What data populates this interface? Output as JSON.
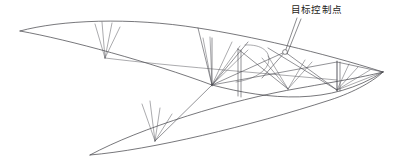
{
  "figure": {
    "kind": "engineering-wireframe-diagram",
    "width": 403,
    "height": 164,
    "background_color": "#ffffff",
    "line_color": "#4a4a50",
    "edge_color": "#3c3c42",
    "text_color": "#1e1e22"
  },
  "annotations": [
    {
      "id": "target-control-point",
      "label": "目标控制点",
      "label_x": 291,
      "label_y": 4,
      "leader_from_x": 297,
      "leader_from_y": 18,
      "leader_to_x": 285,
      "leader_to_y": 52
    }
  ],
  "nodes": [
    {
      "id": "left-tip",
      "x": 20,
      "y": 31
    },
    {
      "id": "upper-fan-apex",
      "x": 105,
      "y": 58
    },
    {
      "id": "mid-junction",
      "x": 212,
      "y": 85
    },
    {
      "id": "lower-fan-apex",
      "x": 155,
      "y": 141
    },
    {
      "id": "bottom-left-tip",
      "x": 90,
      "y": 155
    },
    {
      "id": "control-node",
      "x": 285,
      "y": 52
    },
    {
      "id": "right-post-top",
      "x": 337,
      "y": 62
    },
    {
      "id": "right-post-base",
      "x": 337,
      "y": 90
    },
    {
      "id": "right-tip",
      "x": 383,
      "y": 72
    }
  ],
  "paths": {
    "upper_surface_curve": "M 20 31 C 60 20, 130 17, 198 28 C 250 36, 320 52, 383 72",
    "upper_lower_chord": "M 20 31 C 70 40, 150 62, 212 85 C 270 100, 330 106, 383 72",
    "mid_chord": "M 105 58 C 170 66, 250 72, 337 80",
    "lower_outline_top": "M 90 155 C 140 128, 230 100, 300 88 C 340 81, 368 76, 383 72",
    "lower_outline_bottom": "M 90 155 C 150 150, 250 126, 330 100 C 355 92, 375 80, 383 72",
    "ribbon_curve": "M 245 45 C 262 44, 272 52, 268 64 C 264 74, 250 80, 236 82"
  },
  "fans": [
    {
      "id": "upper-left-fan",
      "apex_x": 105,
      "apex_y": 58,
      "rays": [
        {
          "x": 95,
          "y": 24
        },
        {
          "x": 102,
          "y": 22
        },
        {
          "x": 112,
          "y": 23
        },
        {
          "x": 120,
          "y": 27
        }
      ]
    },
    {
      "id": "lower-left-fan",
      "apex_x": 155,
      "apex_y": 141,
      "rays": [
        {
          "x": 142,
          "y": 104
        },
        {
          "x": 150,
          "y": 101
        },
        {
          "x": 160,
          "y": 108
        },
        {
          "x": 172,
          "y": 114
        }
      ]
    },
    {
      "id": "mid-junction-fan",
      "apex_x": 212,
      "apex_y": 85,
      "rays": [
        {
          "x": 203,
          "y": 38
        },
        {
          "x": 210,
          "y": 37
        },
        {
          "x": 232,
          "y": 42
        },
        {
          "x": 240,
          "y": 46
        },
        {
          "x": 248,
          "y": 50
        }
      ]
    },
    {
      "id": "right-post-fan",
      "apex_x": 337,
      "apex_y": 90,
      "rays": [
        {
          "x": 337,
          "y": 62
        },
        {
          "x": 349,
          "y": 64
        },
        {
          "x": 358,
          "y": 67
        },
        {
          "x": 370,
          "y": 70
        },
        {
          "x": 383,
          "y": 72
        }
      ]
    },
    {
      "id": "center-v-fan",
      "apex_x": 288,
      "apex_y": 89,
      "rays": [
        {
          "x": 262,
          "y": 58
        },
        {
          "x": 268,
          "y": 56
        },
        {
          "x": 305,
          "y": 60
        },
        {
          "x": 312,
          "y": 62
        }
      ]
    }
  ],
  "posts": [
    {
      "id": "post-mid",
      "x1": 238,
      "y1": 49,
      "x2": 238,
      "y2": 96
    },
    {
      "id": "post-mid-2",
      "x1": 241,
      "y1": 50,
      "x2": 241,
      "y2": 97
    },
    {
      "id": "post-right",
      "x1": 337,
      "y1": 61,
      "x2": 337,
      "y2": 91
    },
    {
      "id": "post-right-2",
      "x1": 340,
      "y1": 62,
      "x2": 340,
      "y2": 91
    },
    {
      "id": "post-left-mid",
      "x1": 212,
      "y1": 38,
      "x2": 212,
      "y2": 86
    }
  ],
  "braces": [
    {
      "id": "brace-a",
      "x1": 212,
      "y1": 85,
      "x2": 285,
      "y2": 52
    },
    {
      "id": "brace-b",
      "x1": 212,
      "y1": 85,
      "x2": 337,
      "y2": 62
    },
    {
      "id": "brace-c",
      "x1": 238,
      "y1": 49,
      "x2": 288,
      "y2": 89
    },
    {
      "id": "brace-d",
      "x1": 285,
      "y1": 52,
      "x2": 337,
      "y2": 90
    },
    {
      "id": "brace-e",
      "x1": 155,
      "y1": 141,
      "x2": 212,
      "y2": 85
    },
    {
      "id": "brace-f",
      "x1": 198,
      "y1": 28,
      "x2": 212,
      "y2": 85
    },
    {
      "id": "brace-g",
      "x1": 248,
      "y1": 42,
      "x2": 212,
      "y2": 85
    },
    {
      "id": "brace-h",
      "x1": 268,
      "y1": 48,
      "x2": 337,
      "y2": 90
    },
    {
      "id": "brace-i",
      "x1": 337,
      "y1": 62,
      "x2": 383,
      "y2": 72
    },
    {
      "id": "brace-j",
      "x1": 285,
      "y1": 52,
      "x2": 262,
      "y2": 78
    }
  ]
}
